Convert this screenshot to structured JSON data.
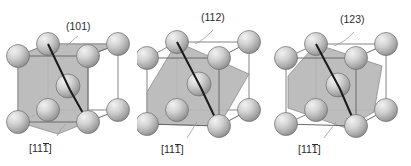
{
  "figure": {
    "title": "",
    "background_color": "#ffffff",
    "panel_count": 3,
    "width": 411,
    "height": 166
  },
  "style": {
    "sphere_light": "#e8e8e8",
    "sphere_mid": "#bfbfbf",
    "sphere_dark": "#8f8f8f",
    "sphere_outline": "#6e6e6e",
    "plane_fill": "#b9b9b9",
    "plane_outline": "#8a8a8a",
    "cell_edge": "#707070",
    "arrow_color": "#1a1a1a",
    "leader_color": "#9a9a9a",
    "text_color": "#2b2b2b"
  },
  "panels": [
    {
      "id": "panel-0",
      "plane_label": "(101)",
      "direction_label_prefix": "[11",
      "direction_label_overbar": "1",
      "direction_label_suffix": "]",
      "plane_indices": [
        1,
        0,
        1
      ],
      "direction_indices": [
        1,
        1,
        -1
      ],
      "lattice": "bcc",
      "atom_count": 9,
      "plane_shape": "rectangle-diagonal"
    },
    {
      "id": "panel-1",
      "plane_label": "(112)",
      "direction_label_prefix": "[11",
      "direction_label_overbar": "1",
      "direction_label_suffix": "]",
      "plane_indices": [
        1,
        1,
        2
      ],
      "direction_indices": [
        1,
        1,
        -1
      ],
      "lattice": "bcc",
      "atom_count": 9,
      "plane_shape": "hexagon"
    },
    {
      "id": "panel-2",
      "plane_label": "(123)",
      "direction_label_prefix": "[11",
      "direction_label_overbar": "1",
      "direction_label_suffix": "]",
      "plane_indices": [
        1,
        2,
        3
      ],
      "direction_indices": [
        1,
        1,
        -1
      ],
      "lattice": "bcc",
      "atom_count": 9,
      "plane_shape": "hexagon-tilted"
    }
  ]
}
